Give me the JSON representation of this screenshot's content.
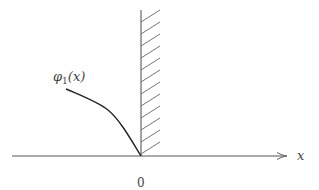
{
  "diagram": {
    "type": "potential-wall",
    "function_label": {
      "symbol": "φ",
      "subscript": "1",
      "argument": "(x)"
    },
    "x_axis_label": "x",
    "origin_label": "0",
    "colors": {
      "axis": "#555555",
      "curve": "#222222",
      "wall": "#666666",
      "hatch": "#666666",
      "text": "#444444"
    },
    "geometry": {
      "axis_y": 156,
      "axis_x_start": 12,
      "axis_x_end": 287,
      "wall_x": 141,
      "wall_top": 10,
      "hatch_count": 12,
      "hatch_spacing": 12,
      "hatch_width": 19
    }
  }
}
